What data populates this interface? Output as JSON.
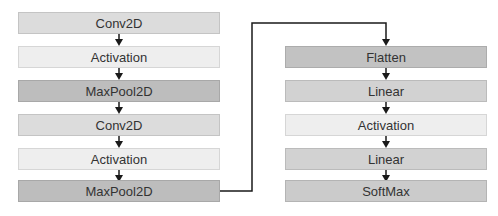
{
  "diagram": {
    "left_column": [
      {
        "label": "Conv2D",
        "type": "conv"
      },
      {
        "label": "Activation",
        "type": "act"
      },
      {
        "label": "MaxPool2D",
        "type": "pool"
      },
      {
        "label": "Conv2D",
        "type": "conv"
      },
      {
        "label": "Activation",
        "type": "act"
      },
      {
        "label": "MaxPool2D",
        "type": "pool"
      }
    ],
    "right_column": [
      {
        "label": "Flatten",
        "type": "flat"
      },
      {
        "label": "Linear",
        "type": "lin"
      },
      {
        "label": "Activation",
        "type": "act"
      },
      {
        "label": "Linear",
        "type": "lin"
      },
      {
        "label": "SoftMax",
        "type": "soft"
      }
    ],
    "connector": "MaxPool2D -> Flatten",
    "colors": {
      "conv": "#dcdcdc",
      "activation": "#eeeeee",
      "pool": "#bdbdbd",
      "flatten": "#c2c2c2",
      "linear": "#d2d2d2",
      "softmax": "#cbcbcb",
      "line": "#1a1a1a"
    }
  }
}
